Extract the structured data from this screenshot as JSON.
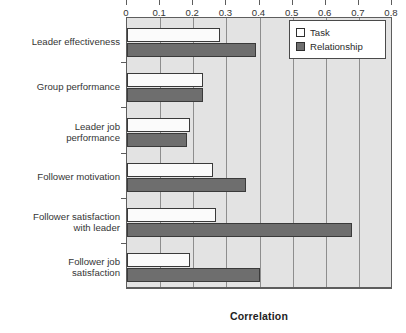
{
  "chart_data": {
    "type": "bar",
    "orientation": "horizontal",
    "title": "",
    "xlabel": "Correlation",
    "ylabel": "",
    "xlim": [
      0,
      0.8
    ],
    "xticks": [
      "0",
      "0.1",
      "0.2",
      "0.3",
      "0.4",
      "0.5",
      "0.6",
      "0.7",
      "0.8"
    ],
    "xtick_values": [
      0,
      0.1,
      0.2,
      0.3,
      0.4,
      0.5,
      0.6,
      0.7,
      0.8
    ],
    "grid": "vertical",
    "legend_position": "top-right",
    "categories": [
      "Leader effectiveness",
      "Group performance",
      "Leader job\nperformance",
      "Follower motivation",
      "Follower satisfaction\nwith leader",
      "Follower job\nsatisfaction"
    ],
    "series": [
      {
        "name": "Task",
        "color": "#ffffff",
        "values": [
          0.28,
          0.23,
          0.19,
          0.26,
          0.27,
          0.19
        ]
      },
      {
        "name": "Relationship",
        "color": "#6e6e6e",
        "values": [
          0.39,
          0.23,
          0.18,
          0.36,
          0.68,
          0.4
        ]
      }
    ]
  },
  "legend": {
    "items": [
      {
        "label": "Task",
        "swatch": "white-square-swatch"
      },
      {
        "label": "Relationship",
        "swatch": "gray-square-swatch"
      }
    ]
  },
  "axis": {
    "x_title": "Correlation"
  },
  "colors": {
    "plot_background": "#e3e3e3",
    "gridline": "#8e8e8e",
    "frame": "#5d5d5d",
    "task_fill": "#fbfbfb",
    "relationship_fill": "#6e6e6e",
    "text": "#353535"
  }
}
